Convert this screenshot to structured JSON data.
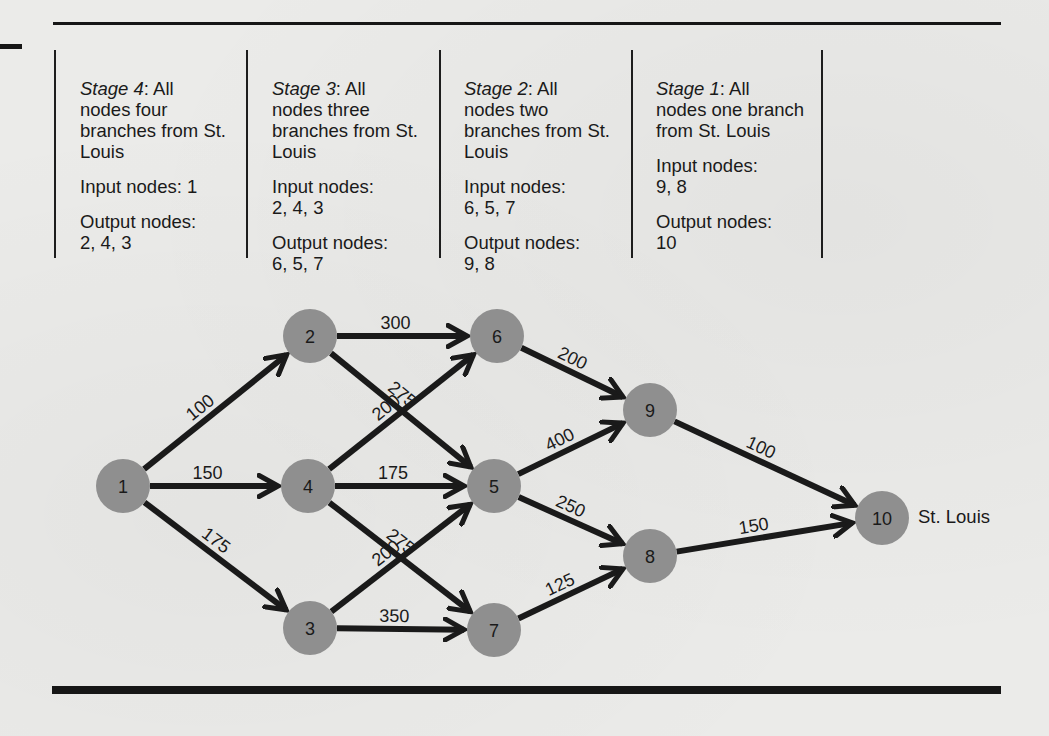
{
  "figure": {
    "stages": [
      {
        "id": "stage-4",
        "title_italic": "Stage 4",
        "title_rest": ":  All",
        "description": "nodes four branches from St. Louis",
        "input_label": "Input nodes:",
        "input_nodes": "1",
        "output_label": "Output nodes:",
        "output_nodes": "2, 4, 3"
      },
      {
        "id": "stage-3",
        "title_italic": "Stage 3",
        "title_rest": ":  All",
        "description": "nodes three branches from St. Louis",
        "input_label": "Input nodes:",
        "input_nodes": "2, 4, 3",
        "output_label": "Output nodes:",
        "output_nodes": "6, 5, 7"
      },
      {
        "id": "stage-2",
        "title_italic": "Stage 2",
        "title_rest": ":  All",
        "description": "nodes two branches from St. Louis",
        "input_label": "Input nodes:",
        "input_nodes": "6, 5, 7",
        "output_label": "Output nodes:",
        "output_nodes": "9, 8"
      },
      {
        "id": "stage-1",
        "title_italic": "Stage 1",
        "title_rest": ":  All",
        "description": "nodes one branch from St. Louis",
        "input_label": "Input nodes:",
        "input_nodes": "9, 8",
        "output_label": "Output nodes:",
        "output_nodes": "10"
      }
    ],
    "destination_label": "St. Louis",
    "nodes": [
      {
        "id": "1",
        "x": 123,
        "y": 486
      },
      {
        "id": "2",
        "x": 310,
        "y": 336
      },
      {
        "id": "4",
        "x": 308,
        "y": 486
      },
      {
        "id": "3",
        "x": 310,
        "y": 628
      },
      {
        "id": "6",
        "x": 497,
        "y": 336
      },
      {
        "id": "5",
        "x": 494,
        "y": 486
      },
      {
        "id": "7",
        "x": 494,
        "y": 630
      },
      {
        "id": "9",
        "x": 650,
        "y": 410
      },
      {
        "id": "8",
        "x": 650,
        "y": 556
      },
      {
        "id": "10",
        "x": 882,
        "y": 518
      }
    ],
    "edges": [
      {
        "from": "1",
        "to": "2",
        "distance": "100"
      },
      {
        "from": "1",
        "to": "4",
        "distance": "150"
      },
      {
        "from": "1",
        "to": "3",
        "distance": "175"
      },
      {
        "from": "2",
        "to": "6",
        "distance": "300"
      },
      {
        "from": "2",
        "to": "5",
        "distance": "275"
      },
      {
        "from": "4",
        "to": "6",
        "distance": "200"
      },
      {
        "from": "4",
        "to": "5",
        "distance": "175"
      },
      {
        "from": "4",
        "to": "7",
        "distance": "275"
      },
      {
        "from": "3",
        "to": "5",
        "distance": "200"
      },
      {
        "from": "3",
        "to": "7",
        "distance": "350"
      },
      {
        "from": "6",
        "to": "9",
        "distance": "200"
      },
      {
        "from": "5",
        "to": "9",
        "distance": "400"
      },
      {
        "from": "5",
        "to": "8",
        "distance": "250"
      },
      {
        "from": "7",
        "to": "8",
        "distance": "125"
      },
      {
        "from": "9",
        "to": "10",
        "distance": "100"
      },
      {
        "from": "8",
        "to": "10",
        "distance": "150"
      }
    ],
    "colors": {
      "node_fill": "#8f8f8f",
      "edge": "#1a1a1a",
      "background": "#ebebe9"
    }
  }
}
